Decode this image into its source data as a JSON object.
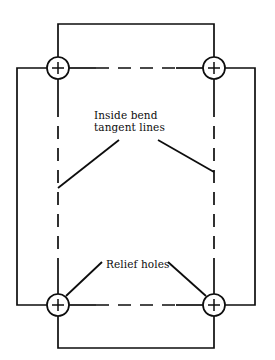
{
  "figure": {
    "kind": "engineering-drawing",
    "view": "flat-pattern plan view",
    "stroke_color": "#0d0d0d",
    "background_color": "#ffffff"
  },
  "annotations": {
    "bend_tangent": {
      "line1": "Inside bend",
      "line2": "tangent  lines"
    },
    "relief_holes": {
      "text": "Relief holes"
    }
  },
  "geometry": {
    "center_marks": "+",
    "holes": [
      {
        "name": "relief-hole-top-left",
        "cx": 58,
        "cy": 68,
        "r": 11
      },
      {
        "name": "relief-hole-top-right",
        "cx": 214,
        "cy": 68,
        "r": 11
      },
      {
        "name": "relief-hole-bottom-left",
        "cx": 58,
        "cy": 305,
        "r": 11
      },
      {
        "name": "relief-hole-bottom-right",
        "cx": 214,
        "cy": 305,
        "r": 11
      }
    ],
    "web": {
      "left": 17,
      "right": 255,
      "top": 68,
      "bottom": 305
    },
    "top_flange": {
      "left": 58,
      "right": 214,
      "top": 24,
      "bottom": 68
    },
    "bottom_flange": {
      "left": 58,
      "right": 214,
      "top": 305,
      "bottom": 348
    },
    "centerlines": {
      "style": "dashed",
      "horizontal": [
        {
          "name": "bend-tangent-line-top",
          "x1": 69,
          "x2": 203,
          "y": 68
        },
        {
          "name": "bend-tangent-line-bottom",
          "x1": 69,
          "x2": 203,
          "y": 305
        }
      ],
      "vertical": [
        {
          "name": "bend-tangent-line-left",
          "x": 58,
          "y1": 79,
          "y2": 294
        },
        {
          "name": "bend-tangent-line-right",
          "x": 214,
          "y1": 79,
          "y2": 294
        }
      ]
    },
    "leaders": {
      "bend_tangent_left": {
        "x1": 119,
        "y1": 140,
        "x2": 58,
        "y2": 188
      },
      "bend_tangent_right": {
        "x1": 158,
        "y1": 140,
        "x2": 214,
        "y2": 172
      },
      "relief_hole_left": {
        "x1": 102,
        "y1": 262,
        "x2": 66,
        "y2": 296
      },
      "relief_hole_right": {
        "x1": 168,
        "y1": 262,
        "x2": 206,
        "y2": 296
      }
    }
  }
}
